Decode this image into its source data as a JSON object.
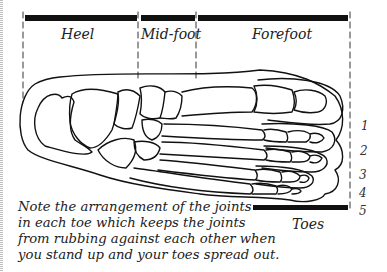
{
  "regions": {
    "heel": "Heel",
    "midfoot": "Mid-foot",
    "forefoot": "Forefoot",
    "toes": "Toes"
  },
  "toe_numbers": [
    "1",
    "2",
    "3",
    "4",
    "5"
  ],
  "caption": {
    "lines": [
      "Note the arrangement of the joints",
      "in each toe which keeps the joints",
      "from rubbing against each other when",
      "you stand up and your toes spread out."
    ]
  },
  "colors": {
    "ink": "#111111",
    "background": "#ffffff"
  }
}
